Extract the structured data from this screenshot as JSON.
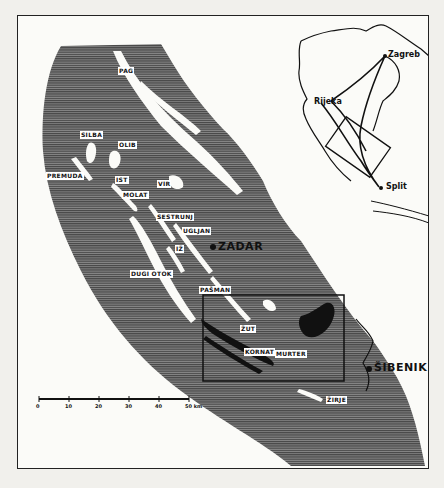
{
  "map": {
    "islands": [
      {
        "id": "pag",
        "label": "PAG",
        "x": 118,
        "y": 67
      },
      {
        "id": "silba",
        "label": "SILBA",
        "x": 80,
        "y": 131
      },
      {
        "id": "olib",
        "label": "OLIB",
        "x": 118,
        "y": 141
      },
      {
        "id": "premuda",
        "label": "PREMUDA",
        "x": 46,
        "y": 172
      },
      {
        "id": "ist",
        "label": "IST",
        "x": 115,
        "y": 176
      },
      {
        "id": "molat",
        "label": "MOLAT",
        "x": 122,
        "y": 191
      },
      {
        "id": "vir",
        "label": "VIR",
        "x": 157,
        "y": 180
      },
      {
        "id": "sestrunj",
        "label": "SESTRUNJ",
        "x": 156,
        "y": 213
      },
      {
        "id": "ugljan",
        "label": "UGLJAN",
        "x": 182,
        "y": 227
      },
      {
        "id": "iz",
        "label": "IŽ",
        "x": 175,
        "y": 245
      },
      {
        "id": "dugi_otok",
        "label": "DUGI OTOK",
        "x": 130,
        "y": 270
      },
      {
        "id": "pasman",
        "label": "PAŠMAN",
        "x": 199,
        "y": 286
      },
      {
        "id": "zut",
        "label": "ŽUT",
        "x": 240,
        "y": 325
      },
      {
        "id": "kornat",
        "label": "KORNAT",
        "x": 244,
        "y": 348
      },
      {
        "id": "murter",
        "label": "MURTER",
        "x": 275,
        "y": 350
      },
      {
        "id": "zirje",
        "label": "ŽIRJE",
        "x": 326,
        "y": 396
      }
    ],
    "cities": [
      {
        "id": "zadar",
        "label": "ZADAR",
        "x": 218,
        "y": 242
      },
      {
        "id": "sibenik",
        "label": "ŠIBENIK",
        "x": 377,
        "y": 367
      }
    ],
    "inset": {
      "cities": [
        {
          "id": "rijeka",
          "label": "Rijeka",
          "x": 314,
          "y": 97
        },
        {
          "id": "zagreb",
          "label": "Zagreb",
          "x": 385,
          "y": 55
        },
        {
          "id": "split",
          "label": "Split",
          "x": 389,
          "y": 188
        }
      ]
    },
    "scale_bar": {
      "ticks": [
        "0",
        "10",
        "20",
        "30",
        "40",
        "50 km"
      ],
      "unit": "km",
      "max": 50
    },
    "study_area_box": {
      "label": "Kornati study area"
    }
  }
}
